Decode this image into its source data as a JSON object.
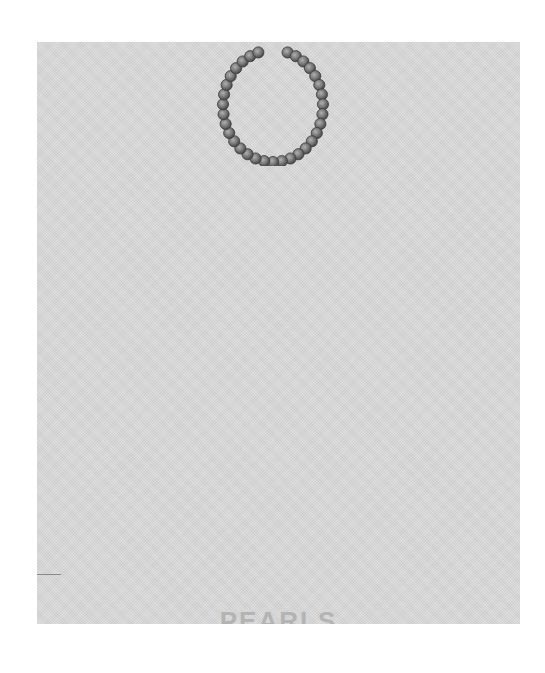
{
  "cover": {
    "background_color": "#d9d9d9",
    "title": "PEARLS",
    "title_color": "#b4b4b4"
  },
  "illustration": {
    "subject": "pearl-necklace",
    "description": "Open loop strand of grey pearls with a gap at the top",
    "pearl_color": "#7a7a7a",
    "pearl_count": 33
  }
}
